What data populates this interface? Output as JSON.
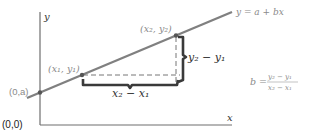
{
  "diagram": {
    "axes": {
      "y_label": "y",
      "x_label": "x",
      "origin_label": "(0,0)"
    },
    "line": {
      "equation_label": "y = a + bx",
      "color": "#808080"
    },
    "points": [
      {
        "label": "(0,a)",
        "name": "y-intercept"
      },
      {
        "label": "(x₁, y₁)",
        "name": "point-1"
      },
      {
        "label": "(x₂, y₂)",
        "name": "point-2"
      }
    ],
    "braces": {
      "rise_label": "y₂ − y₁",
      "run_label": "x₂ − x₁",
      "color": "#3a3a3a"
    },
    "slope_formula": {
      "lhs": "b =",
      "numerator": "y₂ − y₁",
      "denominator": "x₂ − x₁"
    },
    "colors": {
      "axis": "#6e6e6e",
      "label_gray": "#8a8a8a",
      "dark_label": "#333333"
    }
  }
}
